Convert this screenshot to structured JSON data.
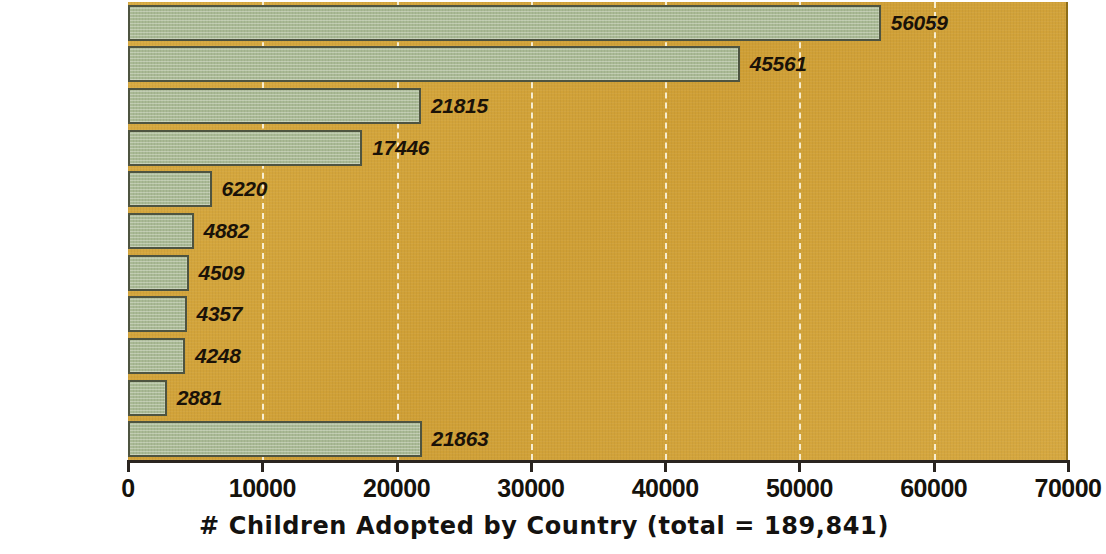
{
  "chart_data": {
    "type": "bar",
    "orientation": "horizontal",
    "title": "",
    "xlabel": "# Children Adopted by Country (total = 189,841)",
    "ylabel": "",
    "xlim": [
      0,
      70000
    ],
    "xticks": [
      0,
      10000,
      20000,
      30000,
      40000,
      50000,
      60000,
      70000
    ],
    "xtick_labels": [
      "0",
      "10000",
      "20000",
      "30000",
      "40000",
      "50000",
      "60000",
      "70000"
    ],
    "grid": "vertical-dashed-white",
    "legend": "none",
    "categories": [
      "China",
      "Russia",
      "Guatemala",
      "Korea",
      "Ukraine",
      "Kazakhstan",
      "Vietnam",
      "India",
      "Romania",
      "Colombia",
      "Other"
    ],
    "values": [
      56059,
      45561,
      21815,
      17446,
      6220,
      4882,
      4509,
      4357,
      4248,
      2881,
      21863
    ],
    "value_labels": [
      "56059",
      "45561",
      "21815",
      "17446",
      "6220",
      "4882",
      "4509",
      "4357",
      "4248",
      "2881",
      "21863"
    ],
    "total": "189,841",
    "colors": {
      "plot_background": "#d3a53c",
      "bar_fill": "#a9b994",
      "bar_border": "#4e5440",
      "gridline": "#fbf4dd",
      "text": "#15120c",
      "axis": "#2a2520",
      "page_background": "#ffffff"
    }
  },
  "axis": {
    "title": "# Children Adopted by Country (total = 189,841)"
  }
}
